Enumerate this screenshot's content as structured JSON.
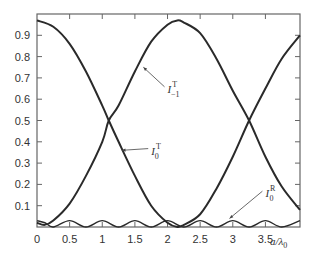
{
  "chart_data": {
    "type": "line",
    "title": "",
    "xlabel": "a/λ0",
    "ylabel": "",
    "xlim": [
      0,
      4.03
    ],
    "ylim": [
      0,
      1.0
    ],
    "grid": false,
    "legend": "inline annotations with leader arrows",
    "x_ticks": [
      0,
      0.5,
      1,
      1.5,
      2,
      2.5,
      3,
      3.5
    ],
    "x_tick_labels": [
      "0",
      "0.5",
      "1",
      "1.5",
      "2",
      "2.5",
      "3",
      "3.5"
    ],
    "y_ticks": [
      0.1,
      0.2,
      0.3,
      0.4,
      0.5,
      0.6,
      0.7,
      0.8,
      0.9
    ],
    "y_tick_labels": [
      "0.1",
      "0.2",
      "0.3",
      "0.4",
      "0.5",
      "0.6",
      "0.7",
      "0.8",
      "0.9"
    ],
    "series": [
      {
        "name": "I_0^T",
        "label_main": "I",
        "label_sup": "T",
        "label_sub": "0",
        "x": [
          0,
          0.25,
          0.5,
          0.75,
          1.0,
          1.1,
          1.25,
          1.5,
          1.75,
          2.0,
          2.15,
          2.25,
          2.5,
          2.75,
          3.0,
          3.25,
          3.5,
          3.75,
          4.03
        ],
        "values": [
          0.97,
          0.94,
          0.86,
          0.73,
          0.57,
          0.5,
          0.4,
          0.24,
          0.1,
          0.02,
          0.0,
          0.01,
          0.06,
          0.18,
          0.33,
          0.5,
          0.65,
          0.79,
          0.9
        ]
      },
      {
        "name": "I_-1^T",
        "label_main": "I",
        "label_sup": "T",
        "label_sub": "−1",
        "x": [
          0,
          0.12,
          0.25,
          0.5,
          0.75,
          1.0,
          1.1,
          1.25,
          1.5,
          1.75,
          2.0,
          2.15,
          2.25,
          2.5,
          2.75,
          3.0,
          3.25,
          3.5,
          3.75,
          4.03
        ],
        "values": [
          0.02,
          0.01,
          0.03,
          0.11,
          0.24,
          0.4,
          0.5,
          0.57,
          0.73,
          0.87,
          0.95,
          0.97,
          0.96,
          0.91,
          0.79,
          0.64,
          0.5,
          0.33,
          0.19,
          0.08
        ]
      },
      {
        "name": "I_0^R",
        "label_main": "I",
        "label_sup": "R",
        "label_sub": "0",
        "x": [
          0,
          0.12,
          0.25,
          0.5,
          0.75,
          1.0,
          1.25,
          1.5,
          1.75,
          2.0,
          2.25,
          2.5,
          2.75,
          3.0,
          3.25,
          3.5,
          3.75,
          4.03
        ],
        "values": [
          0.03,
          0.02,
          0.0,
          0.03,
          0.0,
          0.03,
          0.0,
          0.03,
          0.0,
          0.03,
          0.0,
          0.03,
          0.0,
          0.03,
          0.0,
          0.03,
          0.0,
          0.03
        ],
        "note": "small oscillation near 0 with amplitude ~0.03, period ~0.5"
      }
    ],
    "annotations": [
      {
        "text": "I_-1^T",
        "target_x": 1.63,
        "target_y": 0.75,
        "label_x": 2.0,
        "label_y": 0.63
      },
      {
        "text": "I_0^T",
        "target_x": 1.3,
        "target_y": 0.36,
        "label_x": 1.75,
        "label_y": 0.34
      },
      {
        "text": "I_0^R",
        "target_x": 2.95,
        "target_y": 0.04,
        "label_x": 3.5,
        "label_y": 0.14
      }
    ]
  },
  "labels": {
    "x_axis": "a/λ",
    "x_axis_sub": "0"
  }
}
